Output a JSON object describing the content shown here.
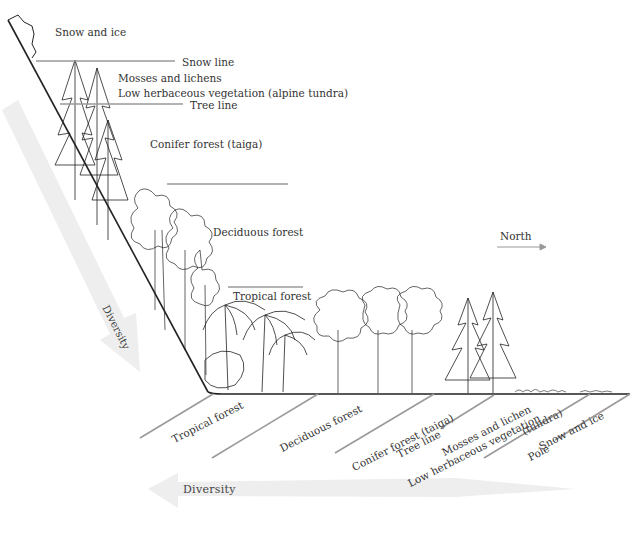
{
  "figure": {
    "type": "biome-zonation-diagram",
    "mountain_labels": {
      "snow_and_ice": "Snow and ice",
      "snow_line": "Snow line",
      "mosses_and_lichens": "Mosses and lichens",
      "low_herbaceous": "Low herbaceous vegetation  (alpine tundra)",
      "tree_line": "Tree line",
      "conifer_forest": "Conifer forest (taiga)",
      "deciduous_forest": "Deciduous forest",
      "tropical_forest": "Tropical forest"
    },
    "latitude_labels": {
      "tropical_forest": "Tropical forest",
      "deciduous_forest": "Deciduous forest",
      "conifer_forest": "Conifer forest (taiga)",
      "tree_line": "Tree line",
      "mosses_and_lichen": "Mosses and lichen",
      "low_herbaceous": "Low herbaceous vegetation",
      "tundra": "(tundra)",
      "snow_and_ice": "Snow and ice",
      "pole": "Pole"
    },
    "direction": {
      "north_label": "North",
      "arrow_icon": "arrow-right-icon"
    },
    "diversity": {
      "vertical_label": "Diversity",
      "horizontal_label": "Diversity"
    },
    "colors": {
      "ink": "#222222",
      "label_line": "#9a9a9a",
      "diversity_arrow": "#ececec",
      "background": "#ffffff"
    }
  }
}
